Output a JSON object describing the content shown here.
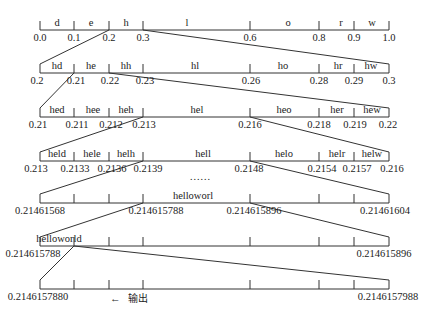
{
  "tick_x": [
    40,
    74,
    109,
    143,
    250,
    319,
    354,
    389
  ],
  "rows": [
    {
      "y": 30,
      "symbols": [
        {
          "label": "d",
          "x": 57
        },
        {
          "label": "e",
          "x": 91
        },
        {
          "label": "h",
          "x": 126
        },
        {
          "label": "l",
          "x": 187
        },
        {
          "label": "o",
          "x": 288
        },
        {
          "label": "r",
          "x": 341
        },
        {
          "label": "w",
          "x": 372
        }
      ],
      "values": [
        {
          "text": "0.0",
          "x": 40
        },
        {
          "text": "0.1",
          "x": 74
        },
        {
          "text": "0.2",
          "x": 109
        },
        {
          "text": "0.3",
          "x": 143
        },
        {
          "text": "0.6",
          "x": 250
        },
        {
          "text": "0.8",
          "x": 319
        },
        {
          "text": "0.9",
          "x": 354
        },
        {
          "text": "1.0",
          "x": 389
        }
      ]
    },
    {
      "y": 73,
      "symbols": [
        {
          "label": "hd",
          "x": 57
        },
        {
          "label": "he",
          "x": 91
        },
        {
          "label": "hh",
          "x": 126
        },
        {
          "label": "hl",
          "x": 195
        },
        {
          "label": "ho",
          "x": 283
        },
        {
          "label": "hr",
          "x": 338
        },
        {
          "label": "hw",
          "x": 371
        }
      ],
      "values": [
        {
          "text": "0.2",
          "x": 37
        },
        {
          "text": "0.21",
          "x": 76
        },
        {
          "text": "0.22",
          "x": 110
        },
        {
          "text": "0.23",
          "x": 145
        },
        {
          "text": "0.26",
          "x": 251
        },
        {
          "text": "0.28",
          "x": 319
        },
        {
          "text": "0.29",
          "x": 354
        },
        {
          "text": "0.3",
          "x": 389
        }
      ]
    },
    {
      "y": 117,
      "symbols": [
        {
          "label": "hed",
          "x": 57
        },
        {
          "label": "hee",
          "x": 93
        },
        {
          "label": "heh",
          "x": 126
        },
        {
          "label": "hel",
          "x": 197
        },
        {
          "label": "heo",
          "x": 284
        },
        {
          "label": "her",
          "x": 337
        },
        {
          "label": "hew",
          "x": 372
        }
      ],
      "values": [
        {
          "text": "0.21",
          "x": 38
        },
        {
          "text": "0.211",
          "x": 77
        },
        {
          "text": "0.212",
          "x": 111
        },
        {
          "text": "0.213",
          "x": 144
        },
        {
          "text": "0.216",
          "x": 250
        },
        {
          "text": "0.218",
          "x": 319
        },
        {
          "text": "0.219",
          "x": 355
        },
        {
          "text": "0.22",
          "x": 388
        }
      ]
    },
    {
      "y": 161,
      "symbols": [
        {
          "label": "held",
          "x": 57
        },
        {
          "label": "hele",
          "x": 92
        },
        {
          "label": "helh",
          "x": 126
        },
        {
          "label": "hell",
          "x": 203
        },
        {
          "label": "helo",
          "x": 284
        },
        {
          "label": "helr",
          "x": 337
        },
        {
          "label": "helw",
          "x": 372
        }
      ],
      "values": [
        {
          "text": "0.213",
          "x": 36
        },
        {
          "text": "0.2133",
          "x": 75
        },
        {
          "text": "0.2136",
          "x": 112
        },
        {
          "text": "0.2139",
          "x": 148
        },
        {
          "text": "0.2148",
          "x": 249
        },
        {
          "text": "0.2154",
          "x": 322
        },
        {
          "text": "0.2157",
          "x": 357
        },
        {
          "text": "0.216",
          "x": 392
        }
      ]
    },
    {
      "y": 203,
      "symbols": [
        {
          "label": "helloworl",
          "x": 193
        }
      ],
      "values": [
        {
          "text": "0.21461568",
          "x": 40,
          "align": "center"
        },
        {
          "text": "0.214615788",
          "x": 156
        },
        {
          "text": "0.214615896",
          "x": 254
        },
        {
          "text": "0.21461604",
          "x": 385
        }
      ]
    },
    {
      "y": 246,
      "symbols": [
        {
          "label": "helloworld",
          "x": 59
        }
      ],
      "values": [
        {
          "text": "0.214615788",
          "x": 33
        },
        {
          "text": "0.214615896",
          "x": 384
        }
      ]
    },
    {
      "y": 289,
      "symbols": [],
      "values": [
        {
          "text": "0.2146157880",
          "x": 38
        },
        {
          "text": "0.2146157988",
          "x": 388
        }
      ]
    }
  ],
  "ellipsis": {
    "text": "……",
    "x": 200,
    "y": 176
  },
  "output": {
    "arrow": "←",
    "label": "输出"
  },
  "connectors": [
    [
      109,
      30,
      40,
      73
    ],
    [
      143,
      30,
      389,
      73
    ],
    [
      74,
      73,
      40,
      117
    ],
    [
      109,
      73,
      389,
      117
    ],
    [
      143,
      117,
      40,
      161
    ],
    [
      250,
      117,
      389,
      161
    ],
    [
      143,
      161,
      40,
      203
    ],
    [
      250,
      161,
      389,
      203
    ],
    [
      143,
      203,
      40,
      246
    ],
    [
      250,
      203,
      389,
      246
    ],
    [
      74,
      246,
      40,
      289
    ],
    [
      74,
      246,
      389,
      289
    ]
  ]
}
